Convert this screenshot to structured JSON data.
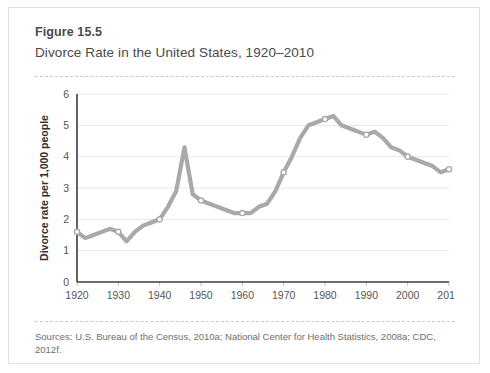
{
  "figure": {
    "number": "Figure 15.5",
    "title": "Divorce Rate in the United States, 1920–2010",
    "sources": "Sources:  U.S. Bureau of the Census, 2010a; National Center for Health Statistics, 2008a; CDC, 2012f."
  },
  "style": {
    "line_color": "#a9a9a9",
    "marker_fill": "#ffffff",
    "marker_stroke": "#a9a9a9",
    "grid_color": "#e6e6e6",
    "axis_color": "#3d3d3d",
    "card_border": "#e2e2e2",
    "dash_color": "#c9c9c9",
    "title_color": "#4a4a4a",
    "source_color": "#6e6e6e"
  },
  "chart_data": {
    "type": "line",
    "title": "Divorce Rate in the United States, 1920–2010",
    "xlabel": "",
    "ylabel": "Divorce rate per 1,000 people",
    "xlim": [
      1920,
      2010
    ],
    "ylim": [
      0,
      6
    ],
    "yticks": [
      0,
      1,
      2,
      3,
      4,
      5,
      6
    ],
    "ytick_labels": [
      "0",
      "1",
      "2",
      "3",
      "4",
      "5",
      "6"
    ],
    "xticks": [
      1920,
      1930,
      1940,
      1950,
      1960,
      1970,
      1980,
      1990,
      2000,
      2010
    ],
    "xtick_labels": [
      "1920",
      "1930",
      "1940",
      "1950",
      "1960",
      "1970",
      "1980",
      "1990",
      "2000",
      "2010"
    ],
    "grid": "horizontal",
    "legend": "none",
    "marker_years": [
      1920,
      1930,
      1940,
      1950,
      1960,
      1970,
      1980,
      1990,
      2000,
      2010
    ],
    "series": [
      {
        "name": "Divorce rate per 1,000 people",
        "x": [
          1920,
          1922,
          1924,
          1926,
          1928,
          1930,
          1932,
          1934,
          1936,
          1938,
          1940,
          1942,
          1944,
          1946,
          1948,
          1950,
          1952,
          1954,
          1956,
          1958,
          1960,
          1962,
          1964,
          1966,
          1968,
          1970,
          1972,
          1974,
          1976,
          1978,
          1980,
          1982,
          1984,
          1986,
          1988,
          1990,
          1992,
          1994,
          1996,
          1998,
          2000,
          2002,
          2004,
          2006,
          2008,
          2010
        ],
        "y": [
          1.6,
          1.4,
          1.5,
          1.6,
          1.7,
          1.6,
          1.3,
          1.6,
          1.8,
          1.9,
          2.0,
          2.4,
          2.9,
          4.3,
          2.8,
          2.6,
          2.5,
          2.4,
          2.3,
          2.2,
          2.2,
          2.2,
          2.4,
          2.5,
          2.9,
          3.5,
          4.0,
          4.6,
          5.0,
          5.1,
          5.2,
          5.3,
          5.0,
          4.9,
          4.8,
          4.7,
          4.8,
          4.6,
          4.3,
          4.2,
          4.0,
          3.9,
          3.8,
          3.7,
          3.5,
          3.6
        ]
      }
    ]
  }
}
